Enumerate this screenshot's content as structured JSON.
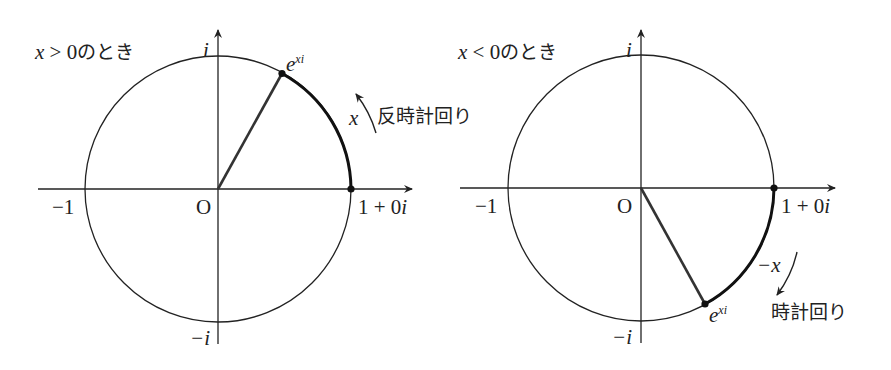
{
  "diagrams": [
    {
      "id": "left",
      "condition_var": "x",
      "condition_op": " > 0",
      "condition_suffix": "のとき",
      "label_i": "i",
      "label_neg_i": "−i",
      "label_neg_one": "−1",
      "label_origin": "O",
      "label_one": "1 + 0",
      "label_one_i": "i",
      "point_base": "e",
      "point_exp": "xi",
      "arc_label": "x",
      "direction_label": "反時計回り"
    },
    {
      "id": "right",
      "condition_var": "x",
      "condition_op": " < 0",
      "condition_suffix": "のとき",
      "label_i": "i",
      "label_neg_i": "−i",
      "label_neg_one": "−1",
      "label_origin": "O",
      "label_one": "1 + 0",
      "label_one_i": "i",
      "point_base": "e",
      "point_exp": "xi",
      "arc_label": "−x",
      "direction_label": "時計回り"
    }
  ]
}
